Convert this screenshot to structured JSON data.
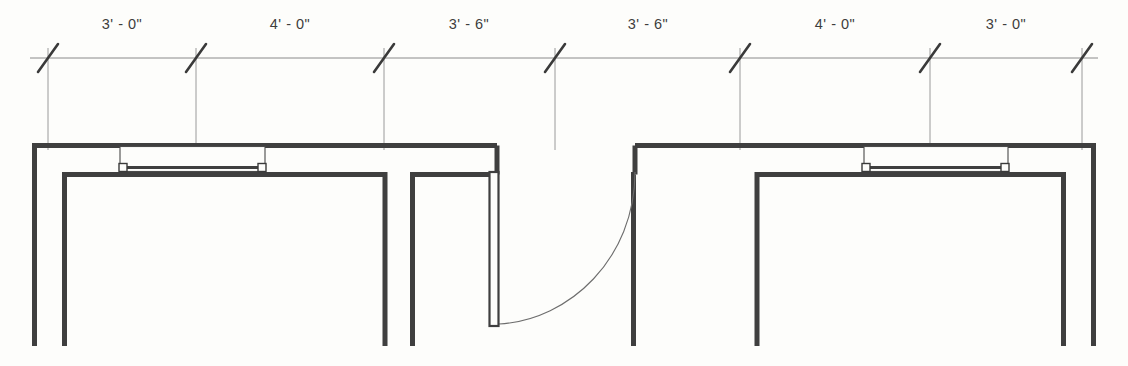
{
  "drawing": {
    "type": "architectural-floor-plan",
    "title": "Partition plan with windows and single swing door",
    "background_color": "#fdfdfb",
    "wall_color": "#3f3f3f",
    "thin_line_color": "#555555",
    "dimension_line_color": "#8a8a8a",
    "tick_color": "#3a3a3a",
    "units": "feet-inches"
  },
  "dimension_string": {
    "line_y": 58,
    "tick_style": "architectural-slash",
    "label_y": 30,
    "ticks_x": [
      48,
      196,
      384,
      555,
      740,
      930,
      1082
    ],
    "segments": [
      {
        "label": "3' - 0\"",
        "start_x": 48,
        "end_x": 196,
        "center_x": 122,
        "feet": 3,
        "inches": 0
      },
      {
        "label": "4' - 0\"",
        "start_x": 196,
        "end_x": 384,
        "center_x": 290,
        "feet": 4,
        "inches": 0
      },
      {
        "label": "3' - 6\"",
        "start_x": 384,
        "end_x": 555,
        "center_x": 469,
        "feet": 3,
        "inches": 6
      },
      {
        "label": "3' - 6\"",
        "start_x": 555,
        "end_x": 740,
        "center_x": 648,
        "feet": 3,
        "inches": 6
      },
      {
        "label": "4' - 0\"",
        "start_x": 740,
        "end_x": 930,
        "center_x": 835,
        "feet": 4,
        "inches": 0
      },
      {
        "label": "3' - 0\"",
        "start_x": 930,
        "end_x": 1082,
        "center_x": 1006,
        "feet": 3,
        "inches": 0
      }
    ],
    "extension_lines": [
      {
        "x": 48,
        "y1": 48,
        "y2": 150
      },
      {
        "x": 196,
        "y1": 48,
        "y2": 170
      },
      {
        "x": 384,
        "y1": 48,
        "y2": 150
      },
      {
        "x": 555,
        "y1": 48,
        "y2": 150
      },
      {
        "x": 740,
        "y1": 48,
        "y2": 150
      },
      {
        "x": 930,
        "y1": 48,
        "y2": 170
      },
      {
        "x": 1082,
        "y1": 48,
        "y2": 150
      }
    ]
  },
  "plan_geometry": {
    "wall_thickness": 5,
    "outer_top_y": 143,
    "inner_top_y": 172,
    "bottom_y": 346,
    "left_outer_x": 32,
    "right_outer_x": 1096,
    "left_room": {
      "outer_left_x": 32,
      "inner_left_x": 62,
      "inner_right_x": 385,
      "head_right_x": 497,
      "name": "left-room"
    },
    "right_room": {
      "outer_right_x": 1096,
      "inner_right_x": 1066,
      "inner_left_x": 757,
      "head_left_x": 635,
      "name": "right-room"
    },
    "center_pier": {
      "left_x": 410,
      "right_x": 497,
      "name": "center-pier"
    }
  },
  "windows": [
    {
      "name": "window-left",
      "x1": 120,
      "x2": 265,
      "outer_y": 146,
      "inner_y": 171,
      "glass_y": 167,
      "jamb_marker_size": 7,
      "label": "Window 3'-0\" sash"
    },
    {
      "name": "window-right",
      "x1": 864,
      "x2": 1008,
      "outer_y": 146,
      "inner_y": 171,
      "glass_y": 167,
      "jamb_marker_size": 7,
      "label": "Window 3'-0\" sash"
    }
  ],
  "door": {
    "name": "door-single-swing",
    "hinge_x": 635,
    "hinge_y": 172,
    "leaf_x": 490,
    "leaf_top_y": 172,
    "leaf_bottom_y": 326,
    "leaf_width": 9,
    "swing_radius": 148,
    "swing_direction": "counter-clockwise",
    "label": "Single swing door"
  },
  "legend": {
    "wall_label": "Wall",
    "window_label": "Window",
    "door_label": "Door",
    "dimension_label": "Dimension"
  }
}
